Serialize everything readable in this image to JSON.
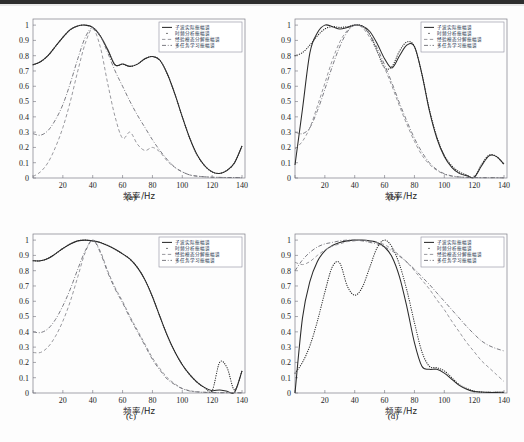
{
  "figure": {
    "background": "#fdfdfd",
    "panel_count": 4,
    "colors": {
      "curve_dark": "#2b2b2b",
      "curve_gray": "#8d8d93",
      "frame": "#7c7c86",
      "legend_text": "#23304a"
    }
  },
  "legend": {
    "position": "top-right",
    "entries": [
      {
        "label": "子波实际振幅谱",
        "style": "solid"
      },
      {
        "label": "时频分析振幅谱",
        "style": "dotted"
      },
      {
        "label": "经验模态分解振幅谱",
        "style": "dashed"
      },
      {
        "label": "多任务学习振幅谱",
        "style": "dash-dot"
      }
    ]
  },
  "axes": {
    "xlabel": "频率/Hz",
    "ylabel": "",
    "xticks": [
      0,
      20,
      40,
      60,
      80,
      100,
      120,
      140
    ],
    "xticklabels": [
      "",
      "20",
      "40",
      "60",
      "80",
      "100",
      "120",
      "140"
    ],
    "yticks": [
      0,
      0.1,
      0.2,
      0.3,
      0.4,
      0.5,
      0.6,
      0.7,
      0.8,
      0.9,
      1
    ],
    "yticklabels": [
      "0",
      "0.1",
      "0.2",
      "0.3",
      "0.4",
      "0.5",
      "0.6",
      "0.7",
      "0.8",
      "0.9",
      "1"
    ],
    "xlim": [
      0,
      142
    ],
    "ylim": [
      0,
      1.04
    ],
    "grid": false
  },
  "captions": {
    "a": "(a)",
    "b": "(b)",
    "c": "(c)",
    "d": "(d)"
  },
  "chart_data": [
    {
      "type": "line",
      "panel": "(a)",
      "title": "",
      "xlabel": "频率/Hz",
      "ylabel": "",
      "xlim": [
        0,
        142
      ],
      "ylim": [
        0,
        1.04
      ],
      "grid": false,
      "legend_position": "upper right",
      "x": [
        0,
        5,
        10,
        15,
        20,
        25,
        30,
        35,
        40,
        45,
        50,
        55,
        60,
        65,
        70,
        75,
        80,
        85,
        90,
        95,
        100,
        105,
        110,
        115,
        120,
        125,
        130,
        135,
        140
      ],
      "series": [
        {
          "name": "子波实际振幅谱",
          "style": "solid",
          "values": [
            0.74,
            0.76,
            0.8,
            0.86,
            0.92,
            0.97,
            0.995,
            1.0,
            0.985,
            0.93,
            0.84,
            0.74,
            0.745,
            0.73,
            0.745,
            0.78,
            0.795,
            0.77,
            0.68,
            0.55,
            0.4,
            0.26,
            0.15,
            0.08,
            0.04,
            0.03,
            0.05,
            0.1,
            0.21
          ]
        },
        {
          "name": "时频分析振幅谱",
          "style": "dotted",
          "values": [
            0.74,
            0.76,
            0.8,
            0.86,
            0.92,
            0.97,
            0.995,
            1.0,
            0.985,
            0.93,
            0.84,
            0.74,
            0.745,
            0.73,
            0.745,
            0.78,
            0.795,
            0.77,
            0.68,
            0.55,
            0.4,
            0.26,
            0.15,
            0.08,
            0.04,
            0.03,
            0.05,
            0.1,
            0.21
          ]
        },
        {
          "name": "经验模态分解振幅谱",
          "style": "dashed",
          "values": [
            0.01,
            0.04,
            0.1,
            0.2,
            0.33,
            0.5,
            0.7,
            0.88,
            0.975,
            0.86,
            0.62,
            0.4,
            0.26,
            0.3,
            0.22,
            0.18,
            0.2,
            0.17,
            0.11,
            0.07,
            0.04,
            0.02,
            0.012,
            0.008,
            0.005,
            0.004,
            0.003,
            0.003,
            0.002
          ]
        },
        {
          "name": "多任务学习振幅谱",
          "style": "dash-dot",
          "values": [
            0.29,
            0.28,
            0.31,
            0.38,
            0.48,
            0.62,
            0.78,
            0.92,
            0.985,
            0.93,
            0.82,
            0.7,
            0.6,
            0.5,
            0.41,
            0.33,
            0.25,
            0.18,
            0.12,
            0.07,
            0.04,
            0.02,
            0.012,
            0.008,
            0.005,
            0.004,
            0.003,
            0.003,
            0.002
          ]
        }
      ]
    },
    {
      "type": "line",
      "panel": "(b)",
      "title": "",
      "xlabel": "频率/Hz",
      "ylabel": "",
      "xlim": [
        0,
        142
      ],
      "ylim": [
        0,
        1.04
      ],
      "grid": false,
      "legend_position": "upper right",
      "x": [
        0,
        5,
        10,
        15,
        20,
        25,
        30,
        35,
        40,
        45,
        50,
        55,
        60,
        65,
        70,
        75,
        80,
        85,
        90,
        95,
        100,
        105,
        110,
        115,
        120,
        125,
        130,
        135,
        140
      ],
      "series": [
        {
          "name": "子波实际振幅谱",
          "style": "solid",
          "values": [
            0.085,
            0.45,
            0.82,
            0.95,
            1.0,
            0.99,
            0.975,
            0.985,
            1.0,
            0.995,
            0.96,
            0.88,
            0.78,
            0.72,
            0.8,
            0.87,
            0.86,
            0.68,
            0.44,
            0.26,
            0.14,
            0.07,
            0.03,
            0.015,
            0.005,
            0.08,
            0.145,
            0.14,
            0.09
          ]
        },
        {
          "name": "时频分析振幅谱",
          "style": "dotted",
          "values": [
            0.8,
            0.82,
            0.87,
            0.93,
            0.975,
            0.99,
            0.985,
            0.99,
            1.0,
            0.995,
            0.94,
            0.83,
            0.72,
            0.73,
            0.83,
            0.89,
            0.86,
            0.68,
            0.45,
            0.27,
            0.15,
            0.08,
            0.04,
            0.02,
            0.005,
            0.09,
            0.15,
            0.14,
            0.09
          ]
        },
        {
          "name": "经验模态分解振幅谱",
          "style": "dashed",
          "values": [
            0.19,
            0.24,
            0.33,
            0.47,
            0.62,
            0.77,
            0.89,
            0.965,
            1.0,
            0.985,
            0.92,
            0.83,
            0.72,
            0.6,
            0.47,
            0.35,
            0.24,
            0.15,
            0.09,
            0.05,
            0.025,
            0.012,
            0.006,
            0.004,
            0.003,
            0.002,
            0.002,
            0.002,
            0.001
          ]
        },
        {
          "name": "多任务学习振幅谱",
          "style": "dash-dot",
          "values": [
            0.3,
            0.29,
            0.33,
            0.44,
            0.58,
            0.73,
            0.86,
            0.955,
            1.0,
            0.99,
            0.94,
            0.85,
            0.74,
            0.62,
            0.49,
            0.37,
            0.26,
            0.17,
            0.1,
            0.055,
            0.028,
            0.014,
            0.007,
            0.004,
            0.003,
            0.002,
            0.002,
            0.002,
            0.001
          ]
        }
      ]
    },
    {
      "type": "line",
      "panel": "(c)",
      "title": "",
      "xlabel": "频率/Hz",
      "ylabel": "",
      "xlim": [
        0,
        142
      ],
      "ylim": [
        0,
        1.04
      ],
      "grid": false,
      "legend_position": "upper right",
      "x": [
        0,
        5,
        10,
        15,
        20,
        25,
        30,
        35,
        40,
        45,
        50,
        55,
        60,
        65,
        70,
        75,
        80,
        85,
        90,
        95,
        100,
        105,
        110,
        115,
        120,
        125,
        130,
        135,
        140
      ],
      "series": [
        {
          "name": "子波实际振幅谱",
          "style": "solid",
          "values": [
            0.865,
            0.865,
            0.88,
            0.91,
            0.945,
            0.975,
            0.995,
            1.0,
            0.995,
            0.985,
            0.965,
            0.94,
            0.91,
            0.875,
            0.82,
            0.74,
            0.63,
            0.5,
            0.375,
            0.27,
            0.185,
            0.12,
            0.07,
            0.035,
            0.015,
            0.02,
            0.012,
            0.005,
            0.145
          ]
        },
        {
          "name": "时频分析振幅谱",
          "style": "dotted",
          "values": [
            0.865,
            0.865,
            0.88,
            0.91,
            0.945,
            0.975,
            0.995,
            1.0,
            0.995,
            0.985,
            0.965,
            0.94,
            0.91,
            0.875,
            0.82,
            0.74,
            0.63,
            0.5,
            0.375,
            0.27,
            0.185,
            0.12,
            0.07,
            0.035,
            0.015,
            0.2,
            0.165,
            0.02,
            0.145
          ]
        },
        {
          "name": "经验模态分解振幅谱",
          "style": "dashed",
          "values": [
            0.265,
            0.265,
            0.3,
            0.37,
            0.47,
            0.6,
            0.76,
            0.92,
            1.0,
            0.93,
            0.8,
            0.69,
            0.6,
            0.5,
            0.41,
            0.32,
            0.23,
            0.16,
            0.1,
            0.06,
            0.03,
            0.015,
            0.008,
            0.005,
            0.003,
            0.002,
            0.002,
            0.002,
            0.001
          ]
        },
        {
          "name": "多任务学习振幅谱",
          "style": "dash-dot",
          "values": [
            0.4,
            0.395,
            0.42,
            0.48,
            0.57,
            0.68,
            0.81,
            0.93,
            1.0,
            0.92,
            0.79,
            0.68,
            0.59,
            0.49,
            0.4,
            0.31,
            0.22,
            0.15,
            0.09,
            0.055,
            0.028,
            0.013,
            0.007,
            0.004,
            0.003,
            0.002,
            0.002,
            0.002,
            0.001
          ]
        }
      ]
    },
    {
      "type": "line",
      "panel": "(d)",
      "title": "",
      "xlabel": "频率/Hz",
      "ylabel": "",
      "xlim": [
        0,
        142
      ],
      "ylim": [
        0,
        1.04
      ],
      "grid": false,
      "legend_position": "upper right",
      "x": [
        0,
        5,
        10,
        15,
        20,
        25,
        30,
        35,
        40,
        45,
        50,
        55,
        60,
        65,
        70,
        75,
        80,
        85,
        90,
        95,
        100,
        105,
        110,
        115,
        120,
        125,
        130,
        135,
        140
      ],
      "series": [
        {
          "name": "子波实际振幅谱",
          "style": "solid",
          "values": [
            0.0,
            0.49,
            0.73,
            0.86,
            0.93,
            0.965,
            0.985,
            0.995,
            1.0,
            1.0,
            0.995,
            0.985,
            0.955,
            0.89,
            0.76,
            0.56,
            0.33,
            0.175,
            0.155,
            0.155,
            0.13,
            0.09,
            0.05,
            0.025,
            0.01,
            0.006,
            0.004,
            0.004,
            0.005
          ]
        },
        {
          "name": "时频分析振幅谱",
          "style": "dotted",
          "values": [
            0.13,
            0.2,
            0.31,
            0.47,
            0.66,
            0.825,
            0.85,
            0.7,
            0.64,
            0.69,
            0.82,
            0.95,
            1.0,
            0.955,
            0.84,
            0.67,
            0.46,
            0.27,
            0.175,
            0.165,
            0.145,
            0.1,
            0.055,
            0.03,
            0.012,
            0.006,
            0.004,
            0.004,
            0.005
          ]
        },
        {
          "name": "经验模态分解振幅谱",
          "style": "dashed",
          "values": [
            0.855,
            0.84,
            0.86,
            0.9,
            0.935,
            0.96,
            0.975,
            0.99,
            0.995,
            1.0,
            0.995,
            0.985,
            0.97,
            0.94,
            0.9,
            0.855,
            0.8,
            0.74,
            0.68,
            0.61,
            0.545,
            0.47,
            0.4,
            0.33,
            0.27,
            0.21,
            0.165,
            0.12,
            0.075
          ]
        },
        {
          "name": "多任务学习振幅谱",
          "style": "dash-dot",
          "values": [
            0.8,
            0.87,
            0.92,
            0.955,
            0.975,
            0.985,
            0.995,
            1.0,
            1.0,
            0.995,
            0.985,
            0.975,
            0.955,
            0.93,
            0.895,
            0.855,
            0.81,
            0.76,
            0.71,
            0.655,
            0.6,
            0.545,
            0.49,
            0.435,
            0.385,
            0.34,
            0.31,
            0.29,
            0.275
          ]
        }
      ]
    }
  ]
}
